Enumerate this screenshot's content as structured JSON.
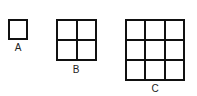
{
  "figures": [
    {
      "label": "A",
      "rows": 1,
      "cols": 1
    },
    {
      "label": "B",
      "rows": 2,
      "cols": 2
    },
    {
      "label": "C",
      "rows": 3,
      "cols": 3
    }
  ],
  "colors": {
    "line": "#111111",
    "background": "#ffffff",
    "text": "#222222"
  }
}
